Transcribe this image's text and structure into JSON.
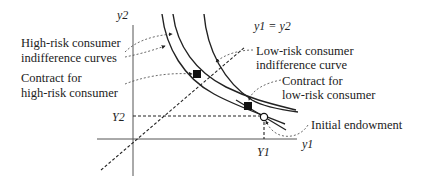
{
  "diagram": {
    "axes": {
      "x_label": "y1",
      "y_label": "y2",
      "x_label_sub": "1",
      "y_label_sub": "2"
    },
    "diagonal_label": "y1 = y2",
    "endowment_ticks": {
      "x_tick": "Y1",
      "y_tick": "Y2"
    },
    "labels": {
      "high_risk_curves_line1": "High-risk consumer",
      "high_risk_curves_line2": "indifference curves",
      "contract_high_line1": "Contract for",
      "contract_high_line2": "high-risk consumer",
      "low_risk_curve_line1": "Low-risk consumer",
      "low_risk_curve_line2": "indifference curve",
      "contract_low_line1": "Contract for",
      "contract_low_line2": "low-risk consumer",
      "endowment": "Initial endowment"
    },
    "markers": {
      "contract_high": "filled-square",
      "contract_low": "filled-square",
      "endowment": "open-circle"
    },
    "colors": {
      "line": "#222222",
      "background": "#ffffff"
    }
  }
}
